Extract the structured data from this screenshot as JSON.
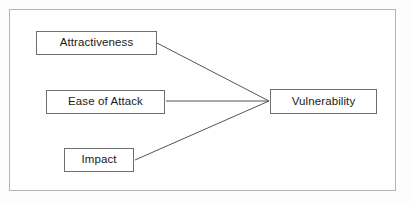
{
  "figure": {
    "background_color": "#ffffff",
    "frame_color": "#b4b4b4",
    "box_border_color": "#6e6e6e",
    "line_color": "#555555",
    "text_color": "#1a1a1a"
  },
  "diagram": {
    "type": "node-link",
    "nodes": [
      {
        "id": "attractiveness",
        "label": "Attractiveness",
        "x": 36,
        "y": 31,
        "width": 121,
        "height": 24
      },
      {
        "id": "ease_of_attack",
        "label": "Ease of Attack",
        "x": 46,
        "y": 90,
        "width": 119,
        "height": 24
      },
      {
        "id": "impact",
        "label": "Impact",
        "x": 64,
        "y": 148,
        "width": 70,
        "height": 24
      },
      {
        "id": "vulnerability",
        "label": "Vulnerability",
        "x": 270,
        "y": 89,
        "width": 107,
        "height": 25
      }
    ],
    "edges": [
      {
        "id": "edge-attractiveness-vulnerability",
        "from": "attractiveness",
        "to": "vulnerability",
        "x1": 157,
        "y1": 43,
        "x2": 269,
        "y2": 101
      },
      {
        "id": "edge-ease-of-attack-vulnerability",
        "from": "ease_of_attack",
        "to": "vulnerability",
        "x1": 166,
        "y1": 101,
        "x2": 269,
        "y2": 101
      },
      {
        "id": "edge-impact-vulnerability",
        "from": "impact",
        "to": "vulnerability",
        "x1": 135,
        "y1": 160,
        "x2": 269,
        "y2": 101
      }
    ]
  }
}
